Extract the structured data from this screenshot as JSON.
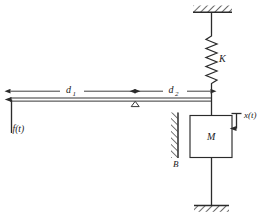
{
  "figure": {
    "type": "mechanical-system-diagram",
    "background_color": "#ffffff",
    "line_color": "#2b2b2b",
    "labels": {
      "spring": "K",
      "mass": "M",
      "damper": "B",
      "distance_left": "d",
      "distance_left_sub": "1",
      "distance_right": "d",
      "distance_right_sub": "2",
      "input_force": "f(t)",
      "output_displacement": "x(t)"
    },
    "components": [
      {
        "name": "ceiling-support",
        "label": ""
      },
      {
        "name": "spring",
        "label": "K"
      },
      {
        "name": "lever-beam",
        "label": ""
      },
      {
        "name": "fulcrum",
        "label": ""
      },
      {
        "name": "mass-block",
        "label": "M"
      },
      {
        "name": "damper-wall",
        "label": "B"
      },
      {
        "name": "ground-support",
        "label": ""
      },
      {
        "name": "force-arrow",
        "label": "f(t)"
      },
      {
        "name": "displacement-arrow",
        "label": "x(t)"
      },
      {
        "name": "dimension-d1",
        "label": "d1"
      },
      {
        "name": "dimension-d2",
        "label": "d2"
      }
    ]
  }
}
